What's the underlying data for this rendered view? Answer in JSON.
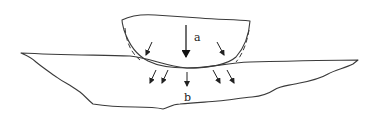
{
  "diagram": {
    "type": "contact-indentation",
    "labels": {
      "a": "a",
      "b": "b"
    },
    "colors": {
      "line": "#3a3a3a",
      "background": "#ffffff"
    },
    "elements": [
      {
        "id": "upper-body",
        "kind": "curved solid (indenter)"
      },
      {
        "id": "lower-body",
        "kind": "irregular solid (substrate)"
      },
      {
        "id": "arrow-a",
        "kind": "applied load arrow",
        "label": "a"
      },
      {
        "id": "arrows-b",
        "kind": "stress distribution arrows",
        "label": "b",
        "count": 5
      },
      {
        "id": "side-arrows",
        "kind": "contact normal arrows",
        "count": 2
      },
      {
        "id": "dashed-outlines",
        "kind": "deformed profile (dashed)",
        "count": 2
      }
    ]
  }
}
